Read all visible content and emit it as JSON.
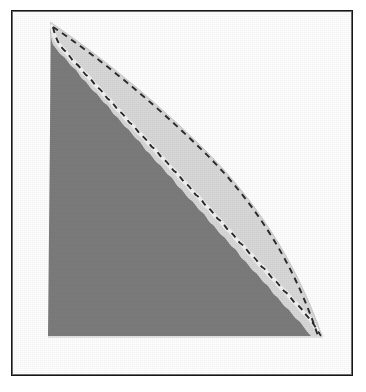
{
  "figure": {
    "title": "",
    "caption": "",
    "frame": {
      "border_color": "#161616",
      "background_color": "#ffffff",
      "x": 11,
      "y": 10,
      "width": 342,
      "height": 366
    },
    "colors": {
      "outer_band_fill": "#d9d9d9",
      "inner_region_fill": "#7b7b7b",
      "separator_gap": "#f2f2f2",
      "dashed_stroke": "#2b2b2b",
      "page_background": "#ffffff"
    }
  },
  "chart_data": {
    "type": "area",
    "title": "",
    "subtitle": "",
    "xlabel": "",
    "ylabel": "",
    "xlim": [
      0,
      1
    ],
    "ylim": [
      0,
      1
    ],
    "grid": false,
    "legend": null,
    "annotations": [],
    "regions": [
      {
        "name": "outer-light-region",
        "fill": "#d9d9d9",
        "description": "Light gray region bounded above-right by the outer convex curve and below-left by the inner scalloped curve",
        "boundary_curve": "outer-convex-boundary"
      },
      {
        "name": "inner-dark-region",
        "fill": "#7b7b7b",
        "description": "Dark gray region filling the lower-left triangle, bounded by the inner scalloped curve",
        "boundary_curve": "inner-scalloped-boundary"
      }
    ],
    "series": [
      {
        "name": "outer-convex-boundary",
        "style": "dashed",
        "stroke": "#2b2b2b",
        "dash_pattern": [
          6,
          5
        ],
        "x": [
          0.115,
          0.185,
          0.26,
          0.34,
          0.425,
          0.51,
          0.595,
          0.68,
          0.755,
          0.825,
          0.885,
          0.93,
          0.96,
          0.98
        ],
        "y": [
          0.97,
          0.905,
          0.84,
          0.775,
          0.705,
          0.635,
          0.56,
          0.48,
          0.395,
          0.305,
          0.22,
          0.15,
          0.095,
          0.06
        ]
      },
      {
        "name": "inner-scalloped-boundary",
        "style": "dashed",
        "stroke": "#2b2b2b",
        "dash_pattern": [
          6,
          5
        ],
        "x": [
          0.115,
          0.16,
          0.215,
          0.275,
          0.335,
          0.4,
          0.465,
          0.53,
          0.6,
          0.665,
          0.73,
          0.79,
          0.85,
          0.9,
          0.945,
          0.975
        ],
        "y": [
          0.965,
          0.905,
          0.845,
          0.785,
          0.725,
          0.665,
          0.6,
          0.535,
          0.465,
          0.395,
          0.32,
          0.25,
          0.185,
          0.13,
          0.085,
          0.055
        ]
      }
    ],
    "apex": {
      "x": 0.115,
      "y": 0.975
    },
    "base_left": {
      "x": 0.115,
      "y": 0.03
    },
    "base_right": {
      "x": 0.985,
      "y": 0.03
    }
  }
}
